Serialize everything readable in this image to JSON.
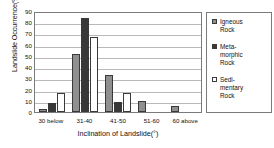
{
  "chart_data": {
    "type": "bar",
    "title": "",
    "xlabel": "Inclination of Landslide(°)",
    "ylabel": "Landslide Occurrence(%)",
    "categories": [
      "30 below",
      "31-40",
      "41-50",
      "51-60",
      "60 above"
    ],
    "ylim": [
      0,
      90
    ],
    "yticks": [
      0,
      10,
      20,
      30,
      40,
      50,
      60,
      70,
      80,
      90
    ],
    "grid": true,
    "legend_position": "right",
    "series": [
      {
        "name": "Igneous\nRock",
        "color": "#8f8f8f",
        "values": [
          3,
          52,
          33,
          10,
          5
        ]
      },
      {
        "name": "Meta-\nmorphic\nRock",
        "color": "#383838",
        "values": [
          8,
          84,
          9,
          0,
          0
        ]
      },
      {
        "name": "Sedi-\nmentary\nRock",
        "color": "#ffffff",
        "values": [
          17,
          67,
          17,
          0,
          0
        ]
      }
    ]
  }
}
